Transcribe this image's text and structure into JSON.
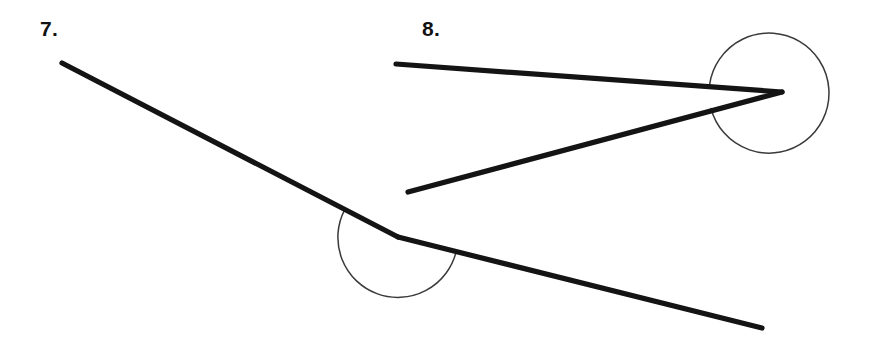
{
  "worksheet": {
    "width": 873,
    "height": 350,
    "background_color": "#ffffff",
    "stroke_color": "#141414",
    "arc_color": "#3a3a3a",
    "label_color": "#111111"
  },
  "problems": [
    {
      "number": "7.",
      "label": "7.",
      "angle_type": "reflex",
      "vertex": {
        "x": 398,
        "y": 237
      },
      "rays": [
        {
          "name": "upper-left-ray",
          "from": {
            "x": 398,
            "y": 237
          },
          "to": {
            "x": 62,
            "y": 63
          }
        },
        {
          "name": "lower-right-ray",
          "from": {
            "x": 398,
            "y": 237
          },
          "to": {
            "x": 762,
            "y": 328
          }
        }
      ],
      "arc": {
        "name": "reflex-angle-arc",
        "center": {
          "x": 398,
          "y": 237
        },
        "radius": 60,
        "start_angle_deg": 207,
        "end_angle_deg": 14,
        "sweep": "clockwise-below-vertex",
        "path": "M 344.6 209.8 A 60 60 0 1 0 456.2 251.5"
      }
    },
    {
      "number": "8.",
      "label": "8.",
      "angle_type": "reflex",
      "vertex": {
        "x": 782,
        "y": 92
      },
      "rays": [
        {
          "name": "upper-left-ray",
          "from": {
            "x": 782,
            "y": 92
          },
          "to": {
            "x": 396,
            "y": 64
          }
        },
        {
          "name": "lower-left-ray",
          "from": {
            "x": 782,
            "y": 92
          },
          "to": {
            "x": 408,
            "y": 192
          }
        }
      ],
      "arc": {
        "name": "reflex-angle-arc",
        "center": {
          "x": 769,
          "y": 93
        },
        "radius": 60,
        "start_angle_deg": 188,
        "end_angle_deg": 165,
        "sweep": "near-full-circle",
        "path": "M 709.6 84.6 A 60 60 0 1 1 711.0 108.5"
      }
    }
  ]
}
